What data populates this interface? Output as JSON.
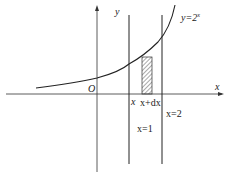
{
  "diagram": {
    "labels": {
      "y_axis": "y",
      "x_axis": "x",
      "origin": "O",
      "curve": "y=2",
      "curve_exp": "x",
      "x_left": "x",
      "x_dx": "x+dx",
      "line1": "x=1",
      "line2": "x=2"
    },
    "colors": {
      "stroke": "#222222",
      "hatch": "#555555"
    }
  }
}
